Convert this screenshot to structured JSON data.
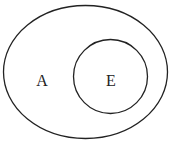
{
  "diagram": {
    "type": "venn",
    "outer_set": {
      "label": "A"
    },
    "inner_set": {
      "label": "E"
    },
    "stroke_color": "#222222",
    "background": "#ffffff"
  }
}
